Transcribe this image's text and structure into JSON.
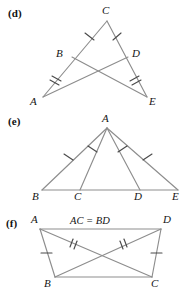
{
  "figure": {
    "line_color": "#8d8d8d",
    "tick_color": "#4a4a4a",
    "background_color": "#ffffff"
  },
  "panels": [
    {
      "id": "d",
      "label": "(d)",
      "shape": "two overlapping triangles sharing apex C with crossing segments BE and DA",
      "vertices": [
        {
          "name": "C",
          "label": "C",
          "x": 107,
          "y": 21,
          "label_x": 102,
          "label_y": 6
        },
        {
          "name": "B",
          "label": "B",
          "x": 72,
          "y": 57,
          "label_x": 56,
          "label_y": 50
        },
        {
          "name": "D",
          "label": "D",
          "x": 128,
          "y": 57,
          "label_x": 132,
          "label_y": 50
        },
        {
          "name": "A",
          "label": "A",
          "x": 43,
          "y": 97,
          "label_x": 31,
          "label_y": 97
        },
        {
          "name": "E",
          "label": "E",
          "x": 147,
          "y": 97,
          "label_x": 148,
          "label_y": 97
        }
      ],
      "segments": [
        {
          "name": "CA",
          "from": "C",
          "to": "A"
        },
        {
          "name": "CE",
          "from": "C",
          "to": "E"
        },
        {
          "name": "BE",
          "from": "B",
          "to": "E"
        },
        {
          "name": "DA",
          "from": "D",
          "to": "A"
        }
      ],
      "tick_marks": [
        {
          "name": "tick-CB",
          "segment": "CB",
          "count": 1
        },
        {
          "name": "tick-CD",
          "segment": "CD",
          "count": 1
        },
        {
          "name": "tick-BA",
          "segment": "BA",
          "count": 2
        },
        {
          "name": "tick-DE",
          "segment": "DE",
          "count": 2
        }
      ]
    },
    {
      "id": "e",
      "label": "(e)",
      "shape": "triangle ABE with two cevians AC and AD drawn to the base",
      "vertices": [
        {
          "name": "A",
          "label": "A",
          "x": 107,
          "y": 128,
          "label_x": 102,
          "label_y": 113
        },
        {
          "name": "B",
          "label": "B",
          "x": 42,
          "y": 190,
          "label_x": 33,
          "label_y": 192
        },
        {
          "name": "C",
          "label": "C",
          "x": 80,
          "y": 190,
          "label_x": 75,
          "label_y": 192
        },
        {
          "name": "D",
          "label": "D",
          "x": 140,
          "y": 190,
          "label_x": 135,
          "label_y": 192
        },
        {
          "name": "E",
          "label": "E",
          "x": 178,
          "y": 190,
          "label_x": 173,
          "label_y": 192
        }
      ],
      "segments": [
        {
          "name": "AB",
          "from": "A",
          "to": "B"
        },
        {
          "name": "AE",
          "from": "A",
          "to": "E"
        },
        {
          "name": "AC",
          "from": "A",
          "to": "C"
        },
        {
          "name": "AD",
          "from": "A",
          "to": "D"
        },
        {
          "name": "BE",
          "from": "B",
          "to": "E"
        }
      ],
      "tick_marks": [
        {
          "name": "tick-AB",
          "segment": "AB",
          "count": 1
        },
        {
          "name": "tick-AC",
          "segment": "AC",
          "count": 1
        },
        {
          "name": "tick-AD",
          "segment": "AD",
          "count": 1
        },
        {
          "name": "tick-AE",
          "segment": "AE",
          "count": 1
        }
      ]
    },
    {
      "id": "f",
      "label": "(f)",
      "shape": "quadrilateral ABCD with crossing diagonals AC and BD",
      "equation": "AC = BD",
      "equation_x": 72,
      "equation_y": 218,
      "vertices": [
        {
          "name": "A",
          "label": "A",
          "x": 40,
          "y": 229,
          "label_x": 32,
          "label_y": 215
        },
        {
          "name": "D",
          "label": "D",
          "x": 161,
          "y": 229,
          "label_x": 162,
          "label_y": 215
        },
        {
          "name": "B",
          "label": "B",
          "x": 55,
          "y": 277,
          "label_x": 45,
          "label_y": 279
        },
        {
          "name": "C",
          "label": "C",
          "x": 152,
          "y": 277,
          "label_x": 150,
          "label_y": 279
        }
      ],
      "segments": [
        {
          "name": "AB",
          "from": "A",
          "to": "B"
        },
        {
          "name": "DC",
          "from": "D",
          "to": "C"
        },
        {
          "name": "BC",
          "from": "B",
          "to": "C"
        },
        {
          "name": "AD",
          "from": "A",
          "to": "D"
        },
        {
          "name": "AC",
          "from": "A",
          "to": "C"
        },
        {
          "name": "BD",
          "from": "B",
          "to": "D"
        }
      ],
      "tick_marks": [
        {
          "name": "tick-AB",
          "segment": "AB",
          "count": 1
        },
        {
          "name": "tick-DC",
          "segment": "DC",
          "count": 1
        },
        {
          "name": "tick-AC",
          "segment": "AC",
          "count": 2
        },
        {
          "name": "tick-BD",
          "segment": "BD",
          "count": 2
        }
      ]
    }
  ]
}
